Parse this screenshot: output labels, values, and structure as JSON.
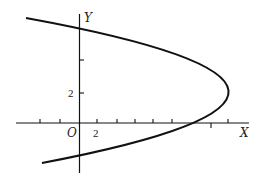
{
  "figure": {
    "type": "parabola-graph",
    "curve": "parabola opening left, vertex near y = 2",
    "axes": {
      "x_label": "X",
      "y_label": "Y",
      "origin_label": "O"
    },
    "tick_labels": {
      "x": "2",
      "y": "2"
    },
    "colors": {
      "ink": "#111111",
      "background": "#ffffff"
    }
  }
}
